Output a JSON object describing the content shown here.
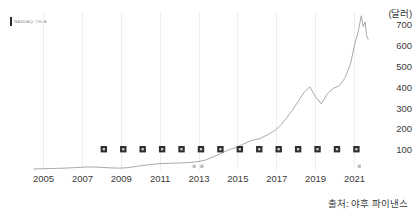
{
  "chart_data": {
    "type": "line",
    "title": "",
    "subtitle": "",
    "xlabel": "",
    "ylabel": "(달러)",
    "unit_label": "(달러)",
    "grid": true,
    "legend_position": "top-left",
    "xlim": [
      2004.3,
      2021.8
    ],
    "ylim": [
      0,
      760
    ],
    "x_tick_labels": [
      "2005",
      "2007",
      "2009",
      "2011",
      "2013",
      "2015",
      "2017",
      "2019",
      "2021"
    ],
    "x_tick_values": [
      2005,
      2007,
      2009,
      2011,
      2013,
      2015,
      2017,
      2019,
      2021
    ],
    "y_tick_labels": [
      "100",
      "200",
      "300",
      "400",
      "500",
      "600",
      "700"
    ],
    "y_tick_values": [
      100,
      200,
      300,
      400,
      500,
      600,
      700
    ],
    "series": [
      {
        "name": "주가",
        "type": "line",
        "color": "#9aa0a6",
        "x": [
          2004.5,
          2004.9,
          2005.3,
          2005.7,
          2006.1,
          2006.5,
          2006.9,
          2007.3,
          2007.7,
          2008.1,
          2008.5,
          2008.9,
          2009.3,
          2009.7,
          2010.1,
          2010.5,
          2010.9,
          2011.3,
          2011.7,
          2012.1,
          2012.5,
          2012.9,
          2013.3,
          2013.7,
          2014.1,
          2014.5,
          2014.9,
          2015.3,
          2015.7,
          2016.1,
          2016.5,
          2016.9,
          2017.2,
          2017.5,
          2017.8,
          2018.1,
          2018.4,
          2018.7,
          2019.0,
          2019.3,
          2019.6,
          2019.9,
          2020.2,
          2020.5,
          2020.8,
          2021.0,
          2021.2,
          2021.35,
          2021.45,
          2021.55,
          2021.62,
          2021.7
        ],
        "values": [
          5,
          6,
          7,
          8,
          9,
          11,
          13,
          15,
          14,
          12,
          10,
          9,
          11,
          16,
          22,
          26,
          30,
          32,
          33,
          34,
          36,
          40,
          47,
          62,
          78,
          96,
          108,
          126,
          142,
          150,
          168,
          190,
          215,
          250,
          286,
          330,
          372,
          400,
          352,
          318,
          366,
          392,
          404,
          440,
          512,
          600,
          668,
          742,
          690,
          712,
          648,
          628
        ]
      }
    ],
    "markers": {
      "name": "이벤트 마커",
      "shape": "square",
      "color": "#2f2f2f",
      "y_value": 100,
      "x": [
        2008.1,
        2009.1,
        2010.1,
        2011.1,
        2012.1,
        2013.1,
        2014.1,
        2015.1,
        2016.1,
        2017.1,
        2018.1,
        2019.1,
        2020.1,
        2021.1
      ]
    },
    "faint_markers": {
      "name": "보조 마커",
      "x": [
        2012.75,
        2013.15,
        2021.25
      ],
      "y_value": 18
    }
  },
  "legend": {
    "label": "NASDAQ: TSLA",
    "swatch_color": "#2b2b2b"
  },
  "source": {
    "text": "출처: 야후 파이낸스"
  }
}
